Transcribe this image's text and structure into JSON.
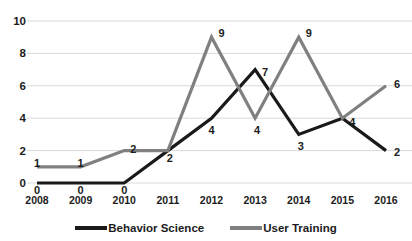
{
  "chart_data": {
    "type": "line",
    "title": "",
    "xlabel": "",
    "ylabel": "",
    "categories": [
      "2008",
      "2009",
      "2010",
      "2011",
      "2012",
      "2013",
      "2014",
      "2015",
      "2016"
    ],
    "series": [
      {
        "name": "Behavior Science",
        "color": "#1a1a1a",
        "values": [
          0,
          0,
          0,
          2,
          4,
          7,
          3,
          4,
          2
        ]
      },
      {
        "name": "User Training",
        "color": "#808080",
        "values": [
          1,
          1,
          2,
          2,
          9,
          4,
          9,
          4,
          6
        ]
      }
    ],
    "ylim": [
      0,
      10
    ],
    "yticks": [
      "0",
      "2",
      "4",
      "6",
      "8",
      "10"
    ],
    "grid": true,
    "grid_color": "#d9d9d9",
    "legend_position": "bottom",
    "data_labels": true
  },
  "legend": {
    "items": [
      {
        "label": "Behavior Science",
        "color": "#1a1a1a"
      },
      {
        "label": "User Training",
        "color": "#808080"
      }
    ]
  }
}
